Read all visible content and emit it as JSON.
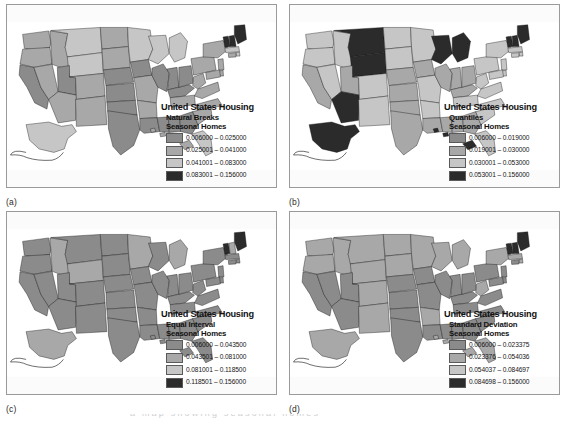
{
  "figure": {
    "background": "#ffffff",
    "panel_border_color": "#9a9a9a",
    "clipped_caption": "a map showing seasonal homes"
  },
  "palette": {
    "class1": "#8b8b8b",
    "class2": "#a8a8a8",
    "class3": "#c6c6c6",
    "class4": "#2b2b2b",
    "outline": "#101010",
    "water": "#ffffff"
  },
  "legend_common": {
    "title": "United States Housing",
    "variable": "Seasonal Homes"
  },
  "panels": [
    {
      "id": "a",
      "label": "(a)",
      "method": "Natural Breaks",
      "legend": {
        "title": "United States Housing",
        "method": "Natural Breaks",
        "variable": "Seasonal Homes",
        "classes": [
          {
            "color": "#8b8b8b",
            "range": "0.006000 – 0.025000"
          },
          {
            "color": "#a8a8a8",
            "range": "0.025001 – 0.041000"
          },
          {
            "color": "#c6c6c6",
            "range": "0.041001 – 0.083000"
          },
          {
            "color": "#2b2b2b",
            "range": "0.083001 – 0.156000"
          }
        ]
      },
      "chart_data": {
        "type": "choropleth-map",
        "title": "United States Housing",
        "subtitle": "Natural Breaks — Seasonal Homes",
        "classification": "Natural Breaks",
        "n_classes": 4,
        "breaks": [
          0.006,
          0.025,
          0.041,
          0.083,
          0.156
        ],
        "class_colors": [
          "#8b8b8b",
          "#a8a8a8",
          "#c6c6c6",
          "#2b2b2b"
        ],
        "state_classes": {
          "WA": 2,
          "OR": 2,
          "CA": 1,
          "NV": 2,
          "ID": 2,
          "MT": 3,
          "WY": 3,
          "UT": 1,
          "AZ": 2,
          "CO": 2,
          "NM": 2,
          "ND": 2,
          "SD": 2,
          "NE": 1,
          "KS": 1,
          "OK": 1,
          "TX": 1,
          "MN": 3,
          "IA": 1,
          "MO": 2,
          "AR": 2,
          "LA": 1,
          "WI": 3,
          "IL": 1,
          "MS": 1,
          "AL": 1,
          "MI": 3,
          "IN": 1,
          "KY": 1,
          "TN": 2,
          "GA": 1,
          "FL": 3,
          "OH": 1,
          "WV": 2,
          "VA": 2,
          "NC": 2,
          "SC": 2,
          "PA": 2,
          "NY": 2,
          "VT": 4,
          "NH": 4,
          "ME": 4,
          "MA": 3,
          "RI": 3,
          "CT": 2,
          "NJ": 2,
          "DE": 2,
          "MD": 2,
          "AK": 3,
          "HI": 2
        }
      }
    },
    {
      "id": "b",
      "label": "(b)",
      "method": "Quantiles",
      "legend": {
        "title": "United States Housing",
        "method": "Quantiles",
        "variable": "Seasonal Homes",
        "classes": [
          {
            "color": "#8b8b8b",
            "range": "0.006000 – 0.019000"
          },
          {
            "color": "#a8a8a8",
            "range": "0.019001 – 0.030000"
          },
          {
            "color": "#c6c6c6",
            "range": "0.030001 – 0.053000"
          },
          {
            "color": "#2b2b2b",
            "range": "0.053001 – 0.156000"
          }
        ]
      },
      "chart_data": {
        "type": "choropleth-map",
        "title": "United States Housing",
        "subtitle": "Quantiles — Seasonal Homes",
        "classification": "Quantiles",
        "n_classes": 4,
        "breaks": [
          0.006,
          0.019,
          0.03,
          0.053,
          0.156
        ],
        "class_colors": [
          "#8b8b8b",
          "#a8a8a8",
          "#c6c6c6",
          "#2b2b2b"
        ],
        "state_classes": {
          "WA": 3,
          "OR": 3,
          "CA": 2,
          "NV": 3,
          "ID": 3,
          "MT": 4,
          "WY": 4,
          "UT": 2,
          "AZ": 4,
          "CO": 3,
          "NM": 3,
          "ND": 3,
          "SD": 3,
          "NE": 2,
          "KS": 2,
          "OK": 2,
          "TX": 2,
          "MN": 3,
          "IA": 2,
          "MO": 3,
          "AR": 3,
          "LA": 2,
          "WI": 4,
          "IL": 2,
          "MS": 2,
          "AL": 2,
          "MI": 4,
          "IN": 2,
          "KY": 2,
          "TN": 3,
          "GA": 2,
          "FL": 3,
          "OH": 2,
          "WV": 3,
          "VA": 3,
          "NC": 3,
          "SC": 3,
          "PA": 3,
          "NY": 3,
          "VT": 4,
          "NH": 4,
          "ME": 4,
          "MA": 3,
          "RI": 3,
          "CT": 3,
          "NJ": 3,
          "DE": 3,
          "MD": 3,
          "AK": 4,
          "HI": 4
        }
      }
    },
    {
      "id": "c",
      "label": "(c)",
      "method": "Equal Interval",
      "legend": {
        "title": "United States Housing",
        "method": "Equal Interval",
        "variable": "Seasonal Homes",
        "classes": [
          {
            "color": "#8b8b8b",
            "range": "0.006000 – 0.043500"
          },
          {
            "color": "#a8a8a8",
            "range": "0.043501 – 0.081000"
          },
          {
            "color": "#c6c6c6",
            "range": "0.081001 – 0.118500"
          },
          {
            "color": "#2b2b2b",
            "range": "0.118501 – 0.156000"
          }
        ]
      },
      "chart_data": {
        "type": "choropleth-map",
        "title": "United States Housing",
        "subtitle": "Equal Interval — Seasonal Homes",
        "classification": "Equal Interval",
        "n_classes": 4,
        "breaks": [
          0.006,
          0.0435,
          0.081,
          0.1185,
          0.156
        ],
        "class_colors": [
          "#8b8b8b",
          "#a8a8a8",
          "#c6c6c6",
          "#2b2b2b"
        ],
        "state_classes": {
          "WA": 1,
          "OR": 1,
          "CA": 1,
          "NV": 1,
          "ID": 2,
          "MT": 1,
          "WY": 2,
          "UT": 1,
          "AZ": 1,
          "CO": 1,
          "NM": 1,
          "ND": 1,
          "SD": 1,
          "NE": 1,
          "KS": 1,
          "OK": 1,
          "TX": 1,
          "MN": 2,
          "IA": 1,
          "MO": 1,
          "AR": 1,
          "LA": 1,
          "WI": 1,
          "IL": 1,
          "MS": 1,
          "AL": 1,
          "MI": 2,
          "IN": 1,
          "KY": 1,
          "TN": 1,
          "GA": 1,
          "FL": 1,
          "OH": 1,
          "WV": 1,
          "VA": 1,
          "NC": 1,
          "SC": 1,
          "PA": 1,
          "NY": 1,
          "VT": 4,
          "NH": 2,
          "ME": 4,
          "MA": 1,
          "RI": 1,
          "CT": 1,
          "NJ": 1,
          "DE": 1,
          "MD": 1,
          "AK": 2,
          "HI": 1
        }
      }
    },
    {
      "id": "d",
      "label": "(d)",
      "method": "Standard Deviation",
      "legend": {
        "title": "United States Housing",
        "method": "Standard Deviation",
        "variable": "Seasonal Homes",
        "classes": [
          {
            "color": "#8b8b8b",
            "range": "0.006000 – 0.023375"
          },
          {
            "color": "#a8a8a8",
            "range": "0.023376 – 0.054036"
          },
          {
            "color": "#c6c6c6",
            "range": "0.054037 – 0.084697"
          },
          {
            "color": "#2b2b2b",
            "range": "0.084698 – 0.156000"
          }
        ]
      },
      "chart_data": {
        "type": "choropleth-map",
        "title": "United States Housing",
        "subtitle": "Standard Deviation — Seasonal Homes",
        "classification": "Standard Deviation",
        "n_classes": 4,
        "breaks": [
          0.006,
          0.023375,
          0.054036,
          0.084697,
          0.156
        ],
        "class_colors": [
          "#8b8b8b",
          "#a8a8a8",
          "#c6c6c6",
          "#2b2b2b"
        ],
        "state_classes": {
          "WA": 2,
          "OR": 2,
          "CA": 1,
          "NV": 1,
          "ID": 2,
          "MT": 2,
          "WY": 2,
          "UT": 1,
          "AZ": 1,
          "CO": 2,
          "NM": 2,
          "ND": 2,
          "SD": 2,
          "NE": 1,
          "KS": 1,
          "OK": 1,
          "TX": 1,
          "MN": 2,
          "IA": 1,
          "MO": 1,
          "AR": 2,
          "LA": 1,
          "WI": 2,
          "IL": 1,
          "MS": 1,
          "AL": 1,
          "MI": 2,
          "IN": 1,
          "KY": 1,
          "TN": 1,
          "GA": 1,
          "FL": 2,
          "OH": 1,
          "WV": 2,
          "VA": 1,
          "NC": 1,
          "SC": 1,
          "PA": 1,
          "NY": 2,
          "VT": 4,
          "NH": 4,
          "ME": 4,
          "MA": 2,
          "RI": 2,
          "CT": 1,
          "NJ": 1,
          "DE": 1,
          "MD": 1,
          "AK": 2,
          "HI": 2
        }
      }
    }
  ]
}
